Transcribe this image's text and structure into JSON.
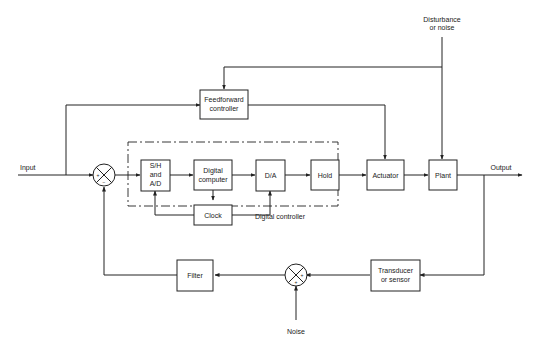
{
  "diagram": {
    "labels": {
      "input": "Input",
      "output": "Output",
      "disturbance_line1": "Disturbance",
      "disturbance_line2": "or noise",
      "noise": "Noise",
      "digital_controller": "Digital controller"
    },
    "blocks": {
      "feedforward": [
        "Feedforward",
        "controller"
      ],
      "sh_ad": [
        "S/H",
        "and",
        "A/D"
      ],
      "digital_computer": [
        "Digital",
        "computer"
      ],
      "da": [
        "D/A"
      ],
      "hold": [
        "Hold"
      ],
      "actuator": [
        "Actuator"
      ],
      "plant": [
        "Plant"
      ],
      "clock": [
        "Clock"
      ],
      "filter": [
        "Filter"
      ],
      "transducer": [
        "Transducer",
        "or sensor"
      ]
    },
    "junctions": {
      "error_sum": {
        "signs": [
          "+",
          "−"
        ]
      },
      "noise_sum": {
        "signs": [
          "+",
          "+"
        ]
      }
    }
  }
}
